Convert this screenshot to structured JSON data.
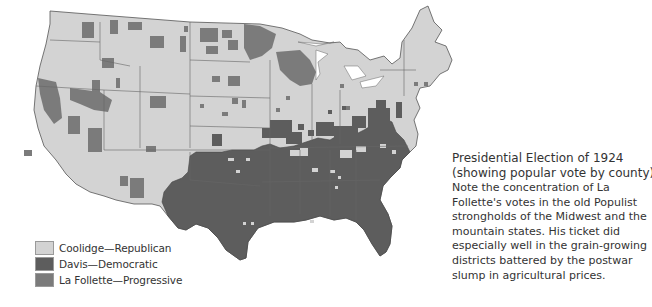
{
  "map": {
    "title": "Presidential Election of 1924",
    "subtitle": "(showing popular vote by county)",
    "description": "Note the concentration of La Follette's votes in the old Populist strongholds of the Midwest and the mountain states. His ticket did especially well in the grain-growing districts battered by the postwar slump in agricultural prices.",
    "region": "Contiguous United States",
    "colors": {
      "republican": "#d3d3d3",
      "democratic": "#5d5d5d",
      "progressive": "#7b7b7b",
      "border": "#4a4a4a",
      "background": "#ffffff"
    },
    "legend": [
      {
        "label": "Coolidge—Republican",
        "color": "#d3d3d3"
      },
      {
        "label": "Davis—Democratic",
        "color": "#5d5d5d"
      },
      {
        "label": "La Follette—Progressive",
        "color": "#7b7b7b"
      }
    ],
    "patterns": {
      "democratic_regions": [
        "Texas",
        "Louisiana",
        "Mississippi",
        "Alabama",
        "Georgia",
        "Florida",
        "South Carolina",
        "North Carolina",
        "Virginia",
        "Arkansas",
        "Tennessee (part)",
        "Kentucky (part)",
        "Oklahoma (part)"
      ],
      "progressive_regions": [
        "Wisconsin",
        "Minnesota (part)",
        "North Dakota (part)",
        "Montana (part)",
        "Washington (part)",
        "California (part)",
        "Nevada (part)",
        "Idaho (part)"
      ],
      "republican_regions": [
        "Northeast",
        "Midwest (most)",
        "West (most)"
      ]
    }
  }
}
